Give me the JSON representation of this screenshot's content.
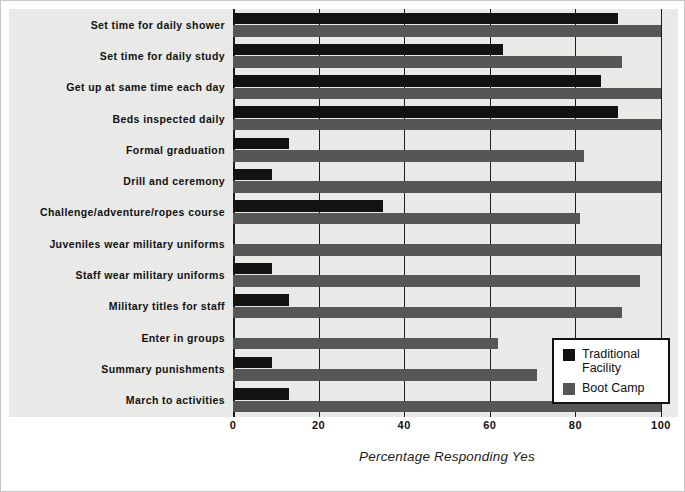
{
  "chart_data": {
    "type": "bar",
    "orientation": "horizontal",
    "title": "",
    "xlabel": "Percentage Responding Yes",
    "ylabel": "",
    "xlim": [
      0,
      100
    ],
    "xticks": [
      0,
      20,
      40,
      60,
      80,
      100
    ],
    "grid": true,
    "legend_position": "lower right",
    "categories": [
      "Set time for daily shower",
      "Set time for daily study",
      "Get up at same time each day",
      "Beds inspected daily",
      "Formal graduation",
      "Drill and ceremony",
      "Challenge/adventure/ropes course",
      "Juveniles wear military uniforms",
      "Staff wear military uniforms",
      "Military titles for staff",
      "Enter in groups",
      "Summary punishments",
      "March to activities"
    ],
    "series": [
      {
        "name": "Traditional Facility",
        "color": "#121212",
        "values": [
          90,
          63,
          86,
          90,
          13,
          9,
          35,
          0,
          9,
          13,
          0,
          9,
          13
        ]
      },
      {
        "name": "Boot Camp",
        "color": "#565656",
        "values": [
          100,
          91,
          100,
          100,
          82,
          100,
          81,
          100,
          95,
          91,
          62,
          71,
          100
        ]
      }
    ]
  },
  "legend": {
    "items": [
      {
        "label": "Traditional Facility",
        "color": "#121212"
      },
      {
        "label": "Boot Camp",
        "color": "#565656"
      }
    ]
  }
}
